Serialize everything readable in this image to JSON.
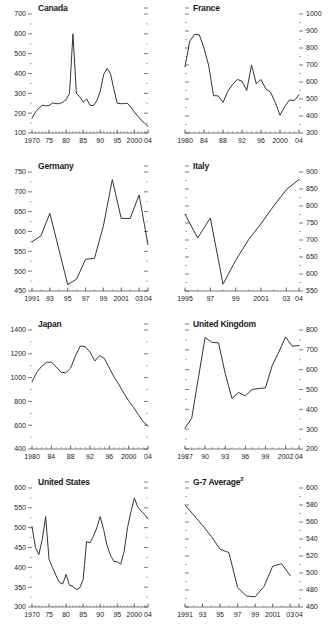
{
  "figure": {
    "panel_order": [
      "canada",
      "france",
      "germany",
      "italy",
      "japan",
      "united_kingdom",
      "united_states",
      "g7_average"
    ]
  },
  "chart_data": [
    {
      "id": "canada",
      "type": "line",
      "title": "Canada",
      "title_dash": "-",
      "xlabel": "",
      "ylabel": "",
      "grid": false,
      "legend": "none",
      "y_axis_side": "left",
      "ylim": [
        100,
        700
      ],
      "yticks": [
        100,
        200,
        300,
        400,
        500,
        600,
        700
      ],
      "ytick_labels": [
        "100",
        "200",
        "300",
        "400",
        "500",
        "600",
        "700"
      ],
      "xlim": [
        1970,
        2004
      ],
      "xticks": [
        1970,
        1975,
        1980,
        1985,
        1990,
        1995,
        2000,
        2004
      ],
      "xtick_labels": [
        "1970",
        "75",
        "80",
        "85",
        "90",
        "95",
        "2000",
        "04"
      ],
      "x": [
        1970,
        1971,
        1972,
        1973,
        1974,
        1975,
        1976,
        1977,
        1978,
        1979,
        1980,
        1981,
        1982,
        1983,
        1984,
        1985,
        1986,
        1987,
        1988,
        1989,
        1990,
        1991,
        1992,
        1993,
        1994,
        1995,
        1996,
        1997,
        1998,
        1999,
        2000,
        2001,
        2002,
        2003,
        2004
      ],
      "values": [
        175,
        205,
        225,
        240,
        237,
        238,
        252,
        248,
        248,
        255,
        268,
        300,
        600,
        300,
        283,
        255,
        272,
        240,
        238,
        262,
        310,
        395,
        425,
        400,
        320,
        250,
        248,
        248,
        250,
        230,
        205,
        185,
        165,
        150,
        133
      ]
    },
    {
      "id": "france",
      "type": "line",
      "title": "France",
      "title_dash": "-",
      "xlabel": "",
      "ylabel": "",
      "grid": false,
      "legend": "none",
      "y_axis_side": "right",
      "ylim": [
        300,
        1000
      ],
      "yticks": [
        300,
        400,
        500,
        600,
        700,
        800,
        900,
        1000
      ],
      "ytick_labels": [
        "300",
        "400",
        "500",
        "600",
        "700",
        "800",
        "900",
        "1000"
      ],
      "xlim": [
        1980,
        2004
      ],
      "xticks": [
        1980,
        1984,
        1988,
        1992,
        1996,
        2000,
        2004
      ],
      "xtick_labels": [
        "1980",
        "84",
        "88",
        "92",
        "96",
        "2000",
        "04"
      ],
      "x": [
        1980,
        1981,
        1982,
        1983,
        1984,
        1985,
        1986,
        1987,
        1988,
        1989,
        1990,
        1991,
        1992,
        1993,
        1994,
        1995,
        1996,
        1997,
        1998,
        1999,
        2000,
        2001,
        2002,
        2003,
        2004
      ],
      "values": [
        690,
        840,
        880,
        878,
        800,
        695,
        520,
        518,
        480,
        545,
        585,
        615,
        605,
        550,
        700,
        590,
        615,
        560,
        540,
        480,
        405,
        455,
        495,
        490,
        525,
        480,
        500
      ]
    },
    {
      "id": "germany",
      "type": "line",
      "title": "Germany",
      "title_dash": "-",
      "xlabel": "",
      "ylabel": "",
      "grid": false,
      "legend": "none",
      "y_axis_side": "left",
      "ylim": [
        450,
        750
      ],
      "yticks": [
        450,
        500,
        550,
        600,
        650,
        700,
        750
      ],
      "ytick_labels": [
        "450",
        "500",
        "550",
        "600",
        "650",
        "700",
        "750"
      ],
      "xlim": [
        1991,
        2004
      ],
      "xticks": [
        1991,
        1993,
        1995,
        1997,
        1999,
        2001,
        2003,
        2004
      ],
      "xtick_labels": [
        "1991",
        "93",
        "95",
        "97",
        "99",
        "2001",
        "03",
        "04"
      ],
      "x": [
        1991,
        1992,
        1993,
        1994,
        1995,
        1996,
        1997,
        1998,
        1999,
        2000,
        2001,
        2002,
        2003,
        2004
      ],
      "values": [
        574,
        589,
        646,
        556,
        466,
        480,
        530,
        532,
        614,
        731,
        633,
        633,
        692,
        567
      ]
    },
    {
      "id": "italy",
      "type": "line",
      "title": "Italy",
      "title_dash": "-",
      "xlabel": "",
      "ylabel": "",
      "grid": false,
      "legend": "none",
      "y_axis_side": "right",
      "ylim": [
        550,
        900
      ],
      "yticks": [
        550,
        600,
        650,
        700,
        750,
        800,
        850,
        900
      ],
      "ytick_labels": [
        "550",
        "600",
        "650",
        "700",
        "750",
        "800",
        "850",
        "900"
      ],
      "xlim": [
        1995,
        2004
      ],
      "xticks": [
        1995,
        1997,
        1999,
        2001,
        2003,
        2004
      ],
      "xtick_labels": [
        "1995",
        "97",
        "99",
        "2001",
        "03",
        "04"
      ],
      "x": [
        1995,
        1996,
        1997,
        1998,
        1999,
        2000,
        2001,
        2002,
        2003,
        2004
      ],
      "values": [
        776,
        706,
        765,
        570,
        640,
        700,
        748,
        800,
        848,
        878
      ]
    },
    {
      "id": "japan",
      "type": "line",
      "title": "Japan",
      "title_dash": "-",
      "xlabel": "",
      "ylabel": "",
      "grid": false,
      "legend": "none",
      "y_axis_side": "left",
      "ylim": [
        400,
        1400
      ],
      "yticks": [
        400,
        600,
        800,
        1000,
        1200,
        1400
      ],
      "ytick_labels": [
        "400",
        "600",
        "800",
        "1000",
        "1200",
        "1400"
      ],
      "xlim": [
        1980,
        2004
      ],
      "xticks": [
        1980,
        1984,
        1988,
        1992,
        1996,
        2000,
        2004
      ],
      "xtick_labels": [
        "1980",
        "84",
        "88",
        "92",
        "96",
        "2000",
        "04"
      ],
      "x": [
        1980,
        1981,
        1982,
        1983,
        1984,
        1985,
        1986,
        1987,
        1988,
        1989,
        1990,
        1991,
        1992,
        1993,
        1994,
        1995,
        1996,
        1997,
        1998,
        1999,
        2000,
        2001,
        2002,
        2003,
        2004
      ],
      "values": [
        965,
        1045,
        1095,
        1128,
        1130,
        1090,
        1045,
        1040,
        1080,
        1185,
        1265,
        1260,
        1215,
        1140,
        1185,
        1160,
        1080,
        1005,
        940,
        870,
        805,
        750,
        690,
        630,
        592
      ]
    },
    {
      "id": "united_kingdom",
      "type": "line",
      "title": "United Kingdom",
      "title_dash": "-",
      "xlabel": "",
      "ylabel": "",
      "grid": false,
      "legend": "none",
      "y_axis_side": "right",
      "ylim": [
        200,
        800
      ],
      "yticks": [
        200,
        300,
        400,
        500,
        600,
        700,
        800
      ],
      "ytick_labels": [
        "200",
        "300",
        "400",
        "500",
        "600",
        "700",
        "800"
      ],
      "xlim": [
        1987,
        2004
      ],
      "xticks": [
        1987,
        1990,
        1993,
        1996,
        1999,
        2002,
        2004
      ],
      "xtick_labels": [
        "1987",
        "90",
        "93",
        "96",
        "99",
        "2002",
        "04"
      ],
      "x": [
        1987,
        1988,
        1989,
        1990,
        1991,
        1992,
        1993,
        1994,
        1995,
        1996,
        1997,
        1998,
        1999,
        2000,
        2001,
        2002,
        2003,
        2004
      ],
      "values": [
        305,
        355,
        560,
        762,
        738,
        735,
        580,
        455,
        485,
        468,
        500,
        505,
        508,
        620,
        690,
        765,
        718,
        722,
        730
      ]
    },
    {
      "id": "united_states",
      "type": "line",
      "title": "United States",
      "title_dash": "-",
      "xlabel": "",
      "ylabel": "",
      "grid": false,
      "legend": "none",
      "y_axis_side": "left",
      "ylim": [
        300,
        600
      ],
      "yticks": [
        300,
        350,
        400,
        450,
        500,
        550,
        600
      ],
      "ytick_labels": [
        "300",
        "350",
        "400",
        "450",
        "500",
        "550",
        "600"
      ],
      "xlim": [
        1970,
        2004
      ],
      "xticks": [
        1970,
        1975,
        1980,
        1985,
        1990,
        1995,
        2000,
        2004
      ],
      "xtick_labels": [
        "1970",
        "75",
        "80",
        "85",
        "90",
        "95",
        "2000",
        "04"
      ],
      "x": [
        1970,
        1971,
        1972,
        1973,
        1974,
        1975,
        1976,
        1977,
        1978,
        1979,
        1980,
        1981,
        1982,
        1983,
        1984,
        1985,
        1986,
        1987,
        1988,
        1989,
        1990,
        1991,
        1992,
        1993,
        1994,
        1995,
        1996,
        1997,
        1998,
        1999,
        2000,
        2001,
        2002,
        2003,
        2004
      ],
      "values": [
        503,
        450,
        432,
        470,
        528,
        420,
        400,
        380,
        362,
        358,
        382,
        355,
        352,
        344,
        348,
        370,
        465,
        462,
        478,
        500,
        528,
        495,
        455,
        430,
        415,
        414,
        408,
        440,
        500,
        540,
        575,
        552,
        542,
        533,
        522
      ]
    },
    {
      "id": "g7_average",
      "type": "line",
      "title": "G-7 Average",
      "title_superscript": "2",
      "title_dash": "-",
      "xlabel": "",
      "ylabel": "",
      "grid": false,
      "legend": "none",
      "y_axis_side": "right",
      "ylim": [
        460,
        600
      ],
      "yticks": [
        460,
        480,
        500,
        520,
        540,
        560,
        580,
        600
      ],
      "ytick_labels": [
        "460",
        "480",
        "500",
        "520",
        "540",
        "560",
        "580",
        "600"
      ],
      "xlim": [
        1991,
        2004
      ],
      "xticks": [
        1991,
        1993,
        1995,
        1997,
        1999,
        2001,
        2003,
        2004
      ],
      "xtick_labels": [
        "1991",
        "93",
        "95",
        "97",
        "99",
        "2001",
        "03",
        "04"
      ],
      "x": [
        1991,
        1992,
        1993,
        1994,
        1995,
        1996,
        1997,
        1998,
        1999,
        2000,
        2001,
        2002,
        2003
      ],
      "values": [
        580,
        568,
        556,
        543,
        528,
        524,
        483,
        473,
        472,
        484,
        508,
        511,
        497,
        477
      ]
    }
  ]
}
